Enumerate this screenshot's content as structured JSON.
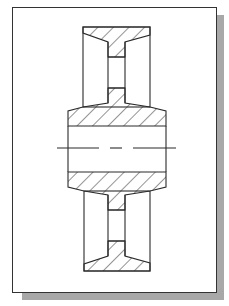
{
  "drawing": {
    "title": "",
    "subject": "pulley-section-view",
    "colors": {
      "line": "#2a2a2a",
      "hatch": "#2a2a2a",
      "background": "#ffffff",
      "shadow": "#a8a8a8"
    },
    "features": [
      "upper-rim-section",
      "upper-web-section",
      "hub-section",
      "centerline",
      "lower-web-section",
      "lower-rim-section"
    ]
  }
}
